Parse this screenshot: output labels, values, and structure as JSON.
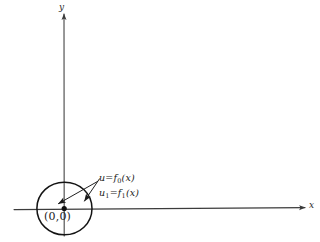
{
  "figure": {
    "kind": "hand-drawn-math-diagram",
    "background_color": "#ffffff",
    "ink_color": "#1a1a1a",
    "axes": {
      "x_label": "x",
      "y_label": "y",
      "origin_label": "(0,0)"
    },
    "annotations": {
      "curve_0": {
        "u": "u",
        "equals": "=",
        "f": "f",
        "sub": "0",
        "arg": "(x)"
      },
      "curve_1": {
        "u": "u",
        "sub_u": "1",
        "equals": "=",
        "f": "f",
        "sub": "1",
        "arg": "(x)"
      }
    },
    "labels": {
      "f0_full": "u = f0(x)",
      "f1_full": "u1 = f1(x)"
    },
    "shapes": {
      "circle_name": "neighborhood-circle",
      "point_name": "origin-point",
      "arrow_0_name": "arrow-to-f0",
      "arrow_1_name": "arrow-to-f1"
    }
  }
}
